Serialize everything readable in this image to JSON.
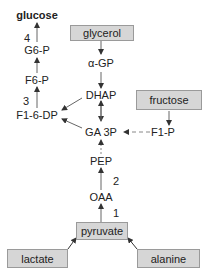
{
  "diagram": {
    "nodes": {
      "glucose": "glucose",
      "g6p": "G6-P",
      "f6p": "F6-P",
      "f16dp": "F1-6-DP",
      "glycerol": "glycerol",
      "agp": "α-GP",
      "dhap": "DHAP",
      "fructose": "fructose",
      "f1p": "F1-P",
      "ga3p": "GA 3P",
      "pep": "PEP",
      "oaa": "OAA",
      "pyruvate": "pyruvate",
      "lactate": "lactate",
      "alanine": "alanine"
    },
    "steps": {
      "s1": "1",
      "s2": "2",
      "s3": "3",
      "s4": "4"
    },
    "colors": {
      "box_fill": "#d6d6d6",
      "box_border": "#9a9a9a",
      "line": "#333333"
    }
  }
}
